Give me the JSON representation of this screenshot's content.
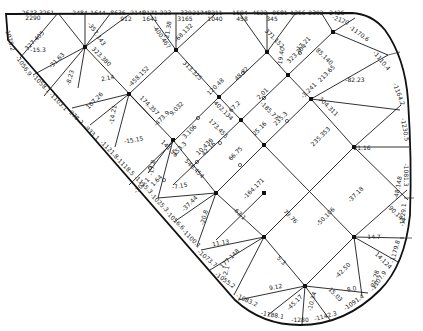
{
  "diagram": {
    "title": "",
    "line_color": "#1a1a1a",
    "boundary_color": "#111111",
    "nodes": [
      {
        "id": "A",
        "x": 58,
        "y": 13
      },
      {
        "id": "B",
        "x": 85,
        "y": 47
      },
      {
        "id": "C",
        "x": 176,
        "y": 50
      },
      {
        "id": "D",
        "x": 267,
        "y": 52
      },
      {
        "id": "E",
        "x": 333,
        "y": 55
      },
      {
        "id": "F",
        "x": 129,
        "y": 94
      },
      {
        "id": "G",
        "x": 219,
        "y": 97
      },
      {
        "id": "H",
        "x": 288,
        "y": 75
      },
      {
        "id": "I",
        "x": 311,
        "y": 99
      },
      {
        "id": "J",
        "x": 173,
        "y": 140
      },
      {
        "id": "K",
        "x": 241,
        "y": 120
      },
      {
        "id": "L",
        "x": 258,
        "y": 145
      },
      {
        "id": "M",
        "x": 216,
        "y": 165
      },
      {
        "id": "N",
        "x": 354,
        "y": 147
      },
      {
        "id": "O",
        "x": 308,
        "y": 120
      },
      {
        "id": "P",
        "x": 264,
        "y": 193
      },
      {
        "id": "Q",
        "x": 161,
        "y": 240
      },
      {
        "id": "R",
        "x": 352,
        "y": 242
      },
      {
        "id": "S",
        "x": 305,
        "y": 286
      }
    ],
    "edges": [
      {
        "from": "A",
        "to": "B",
        "label": "327.405"
      },
      {
        "from": "A",
        "to": "B2",
        "label": ""
      },
      {
        "from": "B",
        "to": "F",
        "label": "323.380"
      },
      {
        "from": "C",
        "to": "F",
        "label": "458.152"
      },
      {
        "from": "C",
        "to": "G",
        "label": "313.325"
      },
      {
        "from": "F",
        "to": "J",
        "label": "374.357"
      },
      {
        "from": "G",
        "to": "K",
        "label": "402.134"
      },
      {
        "from": "K",
        "to": "L",
        "label": "172.455"
      },
      {
        "from": "D",
        "to": "G",
        "label": "48.82"
      },
      {
        "from": "D",
        "to": "H",
        "label": "371.152"
      },
      {
        "from": "H",
        "to": "K",
        "label": "2.01"
      },
      {
        "from": "E",
        "to": "I",
        "label": "213.65"
      },
      {
        "from": "I",
        "to": "N",
        "label": "304.311"
      },
      {
        "from": "J",
        "to": "M",
        "label": "546.454"
      },
      {
        "from": "L",
        "to": "P",
        "label": "62.51"
      },
      {
        "from": "N",
        "to": "R",
        "label": "50.148"
      },
      {
        "from": "N",
        "to": "P",
        "label": "156.102"
      },
      {
        "from": "P",
        "to": "R",
        "label": "79.76"
      },
      {
        "from": "M",
        "to": "Q",
        "label": "63.1"
      },
      {
        "from": "Q",
        "to": "S",
        "label": "5.3"
      },
      {
        "from": "R",
        "to": "S",
        "label": "42.50"
      }
    ],
    "edge_labels": [
      {
        "x": 38,
        "y": 15,
        "rot": 0,
        "text": "2673.3261"
      },
      {
        "x": 33,
        "y": 20,
        "rot": 0,
        "text": "2290"
      },
      {
        "x": 80,
        "y": 15,
        "rot": 0,
        "text": "2484"
      },
      {
        "x": 98,
        "y": 15,
        "rot": 0,
        "text": "1644"
      },
      {
        "x": 118,
        "y": 15,
        "rot": 0,
        "text": "8636"
      },
      {
        "x": 138,
        "y": 15,
        "rot": 0,
        "text": "2145"
      },
      {
        "x": 157,
        "y": 15,
        "rot": 0,
        "text": "2171.223"
      },
      {
        "x": 186,
        "y": 15,
        "rot": 0,
        "text": "339"
      },
      {
        "x": 200,
        "y": 15,
        "rot": 0,
        "text": "2174"
      },
      {
        "x": 215,
        "y": 15,
        "rot": 0,
        "text": "8211"
      },
      {
        "x": 240,
        "y": 15,
        "rot": 0,
        "text": "1594"
      },
      {
        "x": 260,
        "y": 15,
        "rot": 0,
        "text": "4522"
      },
      {
        "x": 280,
        "y": 15,
        "rot": 0,
        "text": "0581"
      },
      {
        "x": 298,
        "y": 15,
        "rot": 0,
        "text": "1256"
      },
      {
        "x": 316,
        "y": 15,
        "rot": 0,
        "text": "2392"
      },
      {
        "x": 337,
        "y": 15,
        "rot": 0,
        "text": "2425"
      },
      {
        "x": 126,
        "y": 21,
        "rot": 0,
        "text": "912"
      },
      {
        "x": 150,
        "y": 21,
        "rot": 0,
        "text": "1641"
      },
      {
        "x": 185,
        "y": 21,
        "rot": 0,
        "text": "3165"
      },
      {
        "x": 215,
        "y": 21,
        "rot": 0,
        "text": "1040"
      },
      {
        "x": 242,
        "y": 21,
        "rot": 0,
        "text": "458"
      },
      {
        "x": 272,
        "y": 21,
        "rot": 0,
        "text": "345"
      },
      {
        "x": 38,
        "y": 52,
        "rot": 0,
        "text": "-15.3"
      },
      {
        "x": 58,
        "y": 62,
        "rot": -45,
        "text": "-31.63"
      },
      {
        "x": 36,
        "y": 42,
        "rot": -45,
        "text": "327.405"
      },
      {
        "x": 95,
        "y": 35,
        "rot": 55,
        "text": "-357.143"
      },
      {
        "x": 72,
        "y": 78,
        "rot": -75,
        "text": "-8.23"
      },
      {
        "x": 100,
        "y": 58,
        "rot": 45,
        "text": "323.380"
      },
      {
        "x": 108,
        "y": 80,
        "rot": -10,
        "text": "2.14"
      },
      {
        "x": 96,
        "y": 102,
        "rot": -45,
        "text": "107.26"
      },
      {
        "x": 115,
        "y": 115,
        "rot": -80,
        "text": "-14.21"
      },
      {
        "x": 140,
        "y": 78,
        "rot": -45,
        "text": "-458.152"
      },
      {
        "x": 148,
        "y": 107,
        "rot": 45,
        "text": "174.357"
      },
      {
        "x": 134,
        "y": 142,
        "rot": -10,
        "text": "-15.15"
      },
      {
        "x": 163,
        "y": 120,
        "rot": -45,
        "text": "-473.9"
      },
      {
        "x": 178,
        "y": 110,
        "rot": -45,
        "text": "9.032"
      },
      {
        "x": 191,
        "y": 72,
        "rot": 45,
        "text": "313.325"
      },
      {
        "x": 160,
        "y": 38,
        "rot": 55,
        "text": "-400.467"
      },
      {
        "x": 170,
        "y": 30,
        "rot": -80,
        "text": "21.38"
      },
      {
        "x": 185,
        "y": 34,
        "rot": -45,
        "text": "-68.132"
      },
      {
        "x": 217,
        "y": 88,
        "rot": -45,
        "text": "120.48"
      },
      {
        "x": 243,
        "y": 75,
        "rot": -45,
        "text": "48.82"
      },
      {
        "x": 222,
        "y": 112,
        "rot": 45,
        "text": "402.134"
      },
      {
        "x": 236,
        "y": 108,
        "rot": -45,
        "text": "67.2"
      },
      {
        "x": 264,
        "y": 95,
        "rot": -45,
        "text": "2.01"
      },
      {
        "x": 268,
        "y": 112,
        "rot": 45,
        "text": "-185.77"
      },
      {
        "x": 261,
        "y": 130,
        "rot": -45,
        "text": "25.16"
      },
      {
        "x": 282,
        "y": 120,
        "rot": -45,
        "text": "235.3"
      },
      {
        "x": 310,
        "y": 92,
        "rot": -45,
        "text": "-3.241"
      },
      {
        "x": 327,
        "y": 108,
        "rot": 45,
        "text": "304.311"
      },
      {
        "x": 322,
        "y": 138,
        "rot": -45,
        "text": "235.353"
      },
      {
        "x": 362,
        "y": 150,
        "rot": 0,
        "text": "21.16"
      },
      {
        "x": 355,
        "y": 82,
        "rot": 0,
        "text": "-82.23"
      },
      {
        "x": 273,
        "y": 40,
        "rot": 45,
        "text": "371.152"
      },
      {
        "x": 283,
        "y": 57,
        "rot": -80,
        "text": "-19.40"
      },
      {
        "x": 298,
        "y": 55,
        "rot": -45,
        "text": "323.304"
      },
      {
        "x": 305,
        "y": 45,
        "rot": -45,
        "text": "17.21"
      },
      {
        "x": 323,
        "y": 58,
        "rot": 45,
        "text": "85.140"
      },
      {
        "x": 328,
        "y": 75,
        "rot": -45,
        "text": "213.65"
      },
      {
        "x": 191,
        "y": 133,
        "rot": -45,
        "text": "3.106"
      },
      {
        "x": 168,
        "y": 150,
        "rot": 45,
        "text": "141.56"
      },
      {
        "x": 181,
        "y": 150,
        "rot": -45,
        "text": "153.3"
      },
      {
        "x": 206,
        "y": 148,
        "rot": -45,
        "text": "10.436"
      },
      {
        "x": 237,
        "y": 155,
        "rot": -45,
        "text": "66.75"
      },
      {
        "x": 217,
        "y": 130,
        "rot": 45,
        "text": "173.455"
      },
      {
        "x": 154,
        "y": 168,
        "rot": -80,
        "text": "-17.8"
      },
      {
        "x": 158,
        "y": 182,
        "rot": -45,
        "text": "1.64"
      },
      {
        "x": 143,
        "y": 187,
        "rot": -45,
        "text": "-102.1"
      },
      {
        "x": 193,
        "y": 170,
        "rot": 45,
        "text": "546.454"
      },
      {
        "x": 210,
        "y": 150,
        "rot": -45,
        "text": "42.16"
      },
      {
        "x": 180,
        "y": 188,
        "rot": -10,
        "text": "-7.15"
      },
      {
        "x": 191,
        "y": 205,
        "rot": -45,
        "text": "-37.44"
      },
      {
        "x": 206,
        "y": 218,
        "rot": -75,
        "text": "-20.8"
      },
      {
        "x": 238,
        "y": 215,
        "rot": 45,
        "text": "-63.1"
      },
      {
        "x": 255,
        "y": 190,
        "rot": -45,
        "text": "-164.171"
      },
      {
        "x": 289,
        "y": 218,
        "rot": 45,
        "text": "79.76"
      },
      {
        "x": 327,
        "y": 218,
        "rot": -45,
        "text": "-50.106"
      },
      {
        "x": 357,
        "y": 196,
        "rot": -45,
        "text": "-37.18"
      },
      {
        "x": 374,
        "y": 239,
        "rot": 0,
        "text": "14.7"
      },
      {
        "x": 382,
        "y": 262,
        "rot": 45,
        "text": "14.124"
      },
      {
        "x": 377,
        "y": 279,
        "rot": -75,
        "text": "21.28"
      },
      {
        "x": 400,
        "y": 188,
        "rot": -80,
        "text": "-48.148"
      },
      {
        "x": 395,
        "y": 215,
        "rot": 45,
        "text": "-90.144"
      },
      {
        "x": 221,
        "y": 245,
        "rot": -10,
        "text": "11.13"
      },
      {
        "x": 231,
        "y": 260,
        "rot": -45,
        "text": "177.148"
      },
      {
        "x": 228,
        "y": 272,
        "rot": -75,
        "text": "-2.1"
      },
      {
        "x": 280,
        "y": 262,
        "rot": 45,
        "text": "5.3"
      },
      {
        "x": 344,
        "y": 272,
        "rot": -45,
        "text": "-42.50"
      },
      {
        "x": 276,
        "y": 289,
        "rot": -10,
        "text": "9.12"
      },
      {
        "x": 296,
        "y": 304,
        "rot": -45,
        "text": "-45.17"
      },
      {
        "x": 314,
        "y": 302,
        "rot": -75,
        "text": "-10.34"
      },
      {
        "x": 334,
        "y": 296,
        "rot": 45,
        "text": "15.03"
      },
      {
        "x": 352,
        "y": 291,
        "rot": -10,
        "text": "8.0"
      }
    ],
    "boundary_labels": [
      {
        "x": 8,
        "y": 40,
        "rot": 75,
        "text": "-1078.2"
      },
      {
        "x": 22,
        "y": 67,
        "rot": 55,
        "text": "-1056.9"
      },
      {
        "x": 40,
        "y": 85,
        "rot": 45,
        "text": "-1058.1"
      },
      {
        "x": 57,
        "y": 103,
        "rot": 45,
        "text": "-1103.1"
      },
      {
        "x": 74,
        "y": 118,
        "rot": 45,
        "text": "-978.2"
      },
      {
        "x": 90,
        "y": 134,
        "rot": 45,
        "text": "-933.1"
      },
      {
        "x": 108,
        "y": 151,
        "rot": 45,
        "text": "-1121.8"
      },
      {
        "x": 124,
        "y": 168,
        "rot": 45,
        "text": "-1118.5"
      },
      {
        "x": 142,
        "y": 186,
        "rot": 45,
        "text": "-1115.3"
      },
      {
        "x": 158,
        "y": 204,
        "rot": 45,
        "text": "-1025.3"
      },
      {
        "x": 174,
        "y": 222,
        "rot": 45,
        "text": "-1056.6"
      },
      {
        "x": 190,
        "y": 240,
        "rot": 45,
        "text": "-1100.1"
      },
      {
        "x": 206,
        "y": 260,
        "rot": 40,
        "text": "-1073.7"
      },
      {
        "x": 224,
        "y": 282,
        "rot": 35,
        "text": "-1055.2"
      },
      {
        "x": 246,
        "y": 302,
        "rot": 25,
        "text": "-1083.2"
      },
      {
        "x": 272,
        "y": 317,
        "rot": 10,
        "text": "-1188.1"
      },
      {
        "x": 300,
        "y": 322,
        "rot": 0,
        "text": "-1280"
      },
      {
        "x": 326,
        "y": 318,
        "rot": -15,
        "text": "-1142.3"
      },
      {
        "x": 355,
        "y": 304,
        "rot": -35,
        "text": "-1091.4"
      },
      {
        "x": 380,
        "y": 282,
        "rot": -55,
        "text": "-1107.9"
      },
      {
        "x": 397,
        "y": 252,
        "rot": -75,
        "text": "-1179.8"
      },
      {
        "x": 405,
        "y": 215,
        "rot": -85,
        "text": "-1129.1"
      },
      {
        "x": 404,
        "y": 175,
        "rot": 90,
        "text": "-1081.3"
      },
      {
        "x": 403,
        "y": 130,
        "rot": 80,
        "text": "-1230.5"
      },
      {
        "x": 397,
        "y": 95,
        "rot": 70,
        "text": "-1164.2"
      },
      {
        "x": 380,
        "y": 62,
        "rot": 50,
        "text": "-1110.4"
      },
      {
        "x": 358,
        "y": 35,
        "rot": 35,
        "text": "-1170.6"
      },
      {
        "x": 340,
        "y": 22,
        "rot": 20,
        "text": "-2120"
      }
    ]
  }
}
